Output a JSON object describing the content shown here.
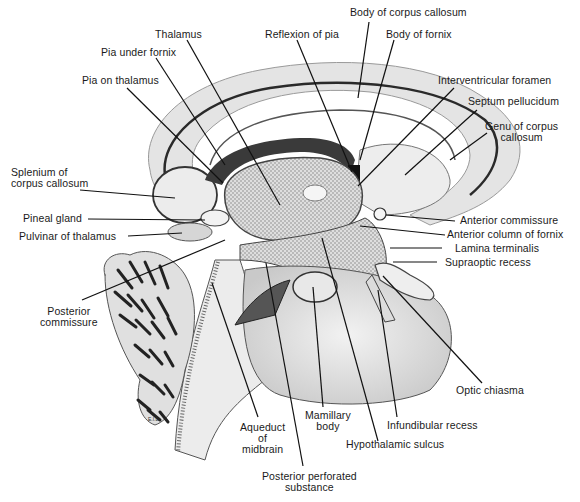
{
  "figure": {
    "colors": {
      "background": "#ffffff",
      "tissue_light": "#e9e9e9",
      "tissue_mid": "#cfcfcf",
      "stipple": "#bdbdbd",
      "ink": "#1a1a1a"
    },
    "signature": "E.I.L.",
    "labels": {
      "body_of_corpus_callosum": "Body of corpus callosum",
      "thalamus": "Thalamus",
      "reflexion_of_pia": "Reflexion of pia",
      "body_of_fornix": "Body of fornix",
      "pia_under_fornix": "Pia under fornix",
      "pia_on_thalamus": "Pia on thalamus",
      "interventricular_foramen": "Interventricular foramen",
      "septum_pellucidum": "Septum pellucidum",
      "genu_line1": "Genu of corpus",
      "genu_line2": "callosum",
      "splenium_line1": "Splenium of",
      "splenium_line2": "corpus callosum",
      "pineal_gland": "Pineal gland",
      "pulvinar_of_thalamus": "Pulvinar of thalamus",
      "anterior_commissure": "Anterior commissure",
      "anterior_column_of_fornix": "Anterior column of fornix",
      "lamina_terminalis": "Lamina terminalis",
      "supraoptic_recess": "Supraoptic recess",
      "posterior_commissure_line1": "Posterior",
      "posterior_commissure_line2": "commissure",
      "optic_chiasma": "Optic chiasma",
      "mamillary_line1": "Mamillary",
      "mamillary_line2": "body",
      "infundibular_recess": "Infundibular recess",
      "aqueduct_line1": "Aqueduct",
      "aqueduct_line2": "of",
      "aqueduct_line3": "midbrain",
      "hypothalamic_sulcus": "Hypothalamic sulcus",
      "ppsubstance_line1": "Posterior perforated",
      "ppsubstance_line2": "substance"
    }
  }
}
